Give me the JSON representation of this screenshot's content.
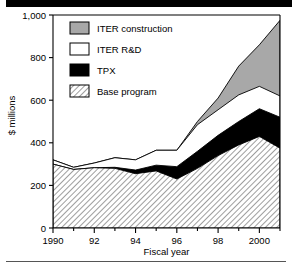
{
  "figure": {
    "name": "stacked-area-fusion-budget"
  },
  "axes": {
    "ylabel": "$ millions",
    "xlabel": "Fiscal year",
    "y_ticks": [
      "0",
      "200",
      "400",
      "600",
      "800",
      "1,000"
    ],
    "x_ticks": [
      "1990",
      "92",
      "94",
      "96",
      "98",
      "2000"
    ]
  },
  "legend": {
    "entries": [
      {
        "label": "ITER construction",
        "swatch": "gray-solid",
        "color": "#a8a8a8"
      },
      {
        "label": "ITER R&D",
        "swatch": "white-solid",
        "color": "#ffffff"
      },
      {
        "label": "TPX",
        "swatch": "black-solid",
        "color": "#000000"
      },
      {
        "label": "Base program",
        "swatch": "gray-hatch",
        "color": "#cccccc"
      }
    ]
  },
  "chart_data": {
    "type": "area",
    "title": "",
    "xlabel": "Fiscal year",
    "ylabel": "$ millions",
    "ylim": [
      0,
      1000
    ],
    "xlim": [
      1990,
      2001
    ],
    "grid": false,
    "stacked": true,
    "legend_position": "upper-left-inside",
    "x": [
      1990,
      1991,
      1992,
      1993,
      1994,
      1995,
      1996,
      1997,
      1998,
      1999,
      2000,
      2001
    ],
    "x_tick_values": [
      1990,
      1992,
      1994,
      1996,
      1998,
      2000
    ],
    "x_tick_labels": [
      "1990",
      "92",
      "94",
      "96",
      "98",
      "2000"
    ],
    "y_tick_values": [
      0,
      200,
      400,
      600,
      800,
      1000
    ],
    "y_tick_labels": [
      "0",
      "200",
      "400",
      "600",
      "800",
      "1,000"
    ],
    "series": [
      {
        "name": "Base program",
        "values": [
          300,
          275,
          283,
          280,
          255,
          268,
          230,
          280,
          340,
          390,
          430,
          375
        ]
      },
      {
        "name": "TPX",
        "values": [
          0,
          0,
          0,
          5,
          17,
          27,
          58,
          80,
          95,
          110,
          130,
          145
        ]
      },
      {
        "name": "ITER R&D",
        "values": [
          20,
          10,
          22,
          45,
          48,
          70,
          77,
          125,
          120,
          125,
          105,
          100
        ]
      },
      {
        "name": "ITER construction",
        "values": [
          0,
          0,
          0,
          0,
          0,
          0,
          0,
          15,
          55,
          135,
          195,
          355
        ]
      }
    ],
    "cumulative_tops": {
      "Base program": [
        300,
        275,
        283,
        280,
        255,
        268,
        230,
        280,
        340,
        390,
        430,
        375
      ],
      "TPX": [
        300,
        275,
        283,
        285,
        272,
        295,
        288,
        360,
        435,
        500,
        560,
        520
      ],
      "ITER R&D": [
        320,
        285,
        305,
        330,
        320,
        365,
        365,
        485,
        555,
        625,
        665,
        620
      ],
      "ITER construction": [
        320,
        285,
        305,
        330,
        320,
        365,
        365,
        500,
        610,
        760,
        860,
        975
      ]
    }
  }
}
